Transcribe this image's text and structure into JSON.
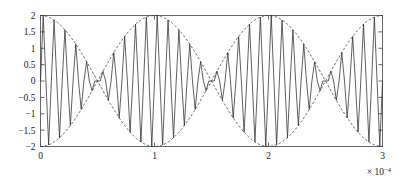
{
  "chart_data": {
    "type": "line",
    "title": "",
    "xlabel": "",
    "ylabel": "",
    "xlim": [
      0,
      0.0003
    ],
    "ylim": [
      -2,
      2
    ],
    "grid": false,
    "legend": null,
    "x_tick_labels": [
      "0",
      "1",
      "2",
      "3"
    ],
    "x_tick_values": [
      0,
      0.0001,
      0.0002,
      0.0003
    ],
    "x_axis_multiplier_base": "× 10",
    "x_axis_multiplier_exponent": "−4",
    "y_tick_labels": [
      "2",
      "1.5",
      "1",
      "0.5",
      "0",
      "−0.5",
      "−1",
      "−1.5",
      "−2"
    ],
    "y_tick_values": [
      2,
      1.5,
      1,
      0.5,
      0,
      -0.5,
      -1,
      -1.5,
      -2
    ],
    "series": [
      {
        "name": "modulated-signal",
        "style": "solid",
        "color": "#2b2b2b",
        "description": "Sum of two equal-amplitude sinusoids producing a beat (amplitude-modulated) waveform, plotted with sparse sample points giving the angular appearance.",
        "model": {
          "kind": "beat_sum_of_sines",
          "amplitude_each": 1,
          "carrier_frequency_hz": 105000,
          "beat_half_frequency_hz": 5000,
          "sample_rate_hz": 420000,
          "samples": 127,
          "peak_amplitude": 2
        }
      },
      {
        "name": "upper-envelope",
        "style": "dashed",
        "color": "#2b2b2b",
        "description": "Upper envelope +2*|cos(2*pi*5000*t)|, dashed",
        "model": {
          "kind": "envelope_upper",
          "amplitude": 2,
          "beat_half_frequency_hz": 5000
        }
      },
      {
        "name": "lower-envelope",
        "style": "dashed",
        "color": "#2b2b2b",
        "description": "Lower envelope -2*|cos(2*pi*5000*t)|, dashed",
        "model": {
          "kind": "envelope_lower",
          "amplitude": 2,
          "beat_half_frequency_hz": 5000
        }
      }
    ],
    "envelope_maxima_x": [
      2.5e-05,
      0.000125,
      0.000225
    ],
    "envelope_nodes_x": [
      7.5e-05,
      0.000175,
      0.000275
    ],
    "envelope_period": 0.0001
  },
  "colors": {
    "axis": "#555555",
    "curve": "#2b2b2b",
    "background": "#ffffff"
  }
}
